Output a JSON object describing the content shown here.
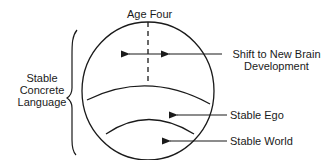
{
  "diagram": {
    "top_label": "Age Four",
    "left_label": [
      "Stable",
      "Concrete",
      "Language"
    ],
    "shift_label": [
      "Shift to New Brain",
      "Development"
    ],
    "ego_label": "Stable Ego",
    "world_label": "Stable World"
  },
  "colors": {
    "stroke": "#1a1a1a",
    "background": "#ffffff"
  }
}
